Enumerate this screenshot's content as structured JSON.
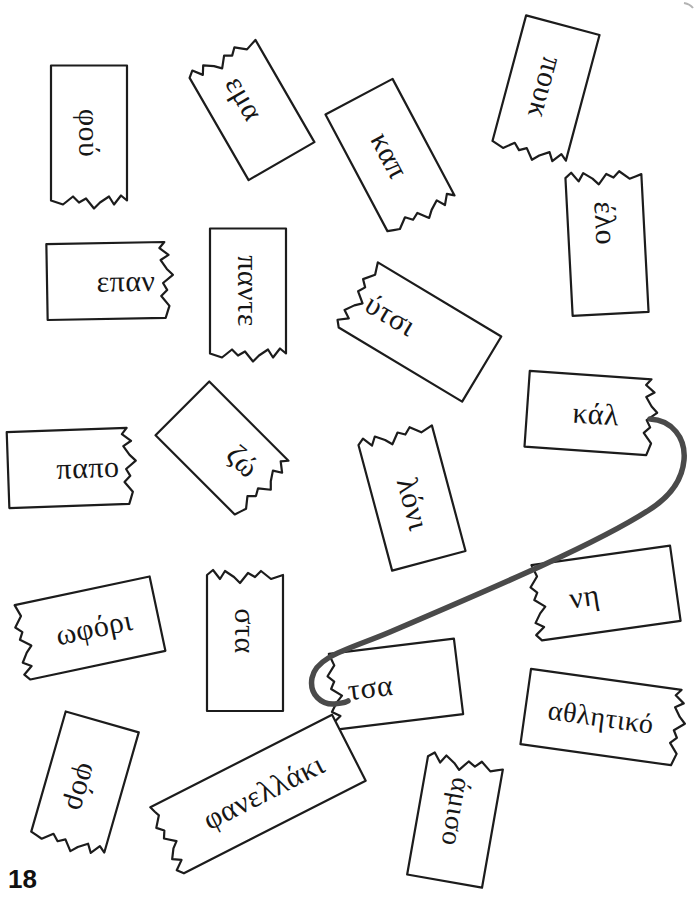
{
  "page": {
    "number": "18"
  },
  "exercise": {
    "kind": "match-torn-word-halves",
    "connection": {
      "from": "κάλ",
      "to": "τσα"
    }
  },
  "pieces": [
    {
      "id": "fou",
      "label": "φού"
    },
    {
      "id": "ema",
      "label": "εμα"
    },
    {
      "id": "kap",
      "label": "καπ"
    },
    {
      "id": "pouk",
      "label": "πουκ"
    },
    {
      "id": "elo",
      "label": "έλο"
    },
    {
      "id": "epan",
      "label": "επαν"
    },
    {
      "id": "pante",
      "label": "παντε"
    },
    {
      "id": "ytsi",
      "label": "ύτσι"
    },
    {
      "id": "papo",
      "label": "παπο"
    },
    {
      "id": "zo",
      "label": "ζώ"
    },
    {
      "id": "loni",
      "label": "λόνι"
    },
    {
      "id": "kal",
      "label": "κάλ"
    },
    {
      "id": "ofori",
      "label": "ωφόρι"
    },
    {
      "id": "sta",
      "label": "στα"
    },
    {
      "id": "ni",
      "label": "νη"
    },
    {
      "id": "tsa",
      "label": "τσα"
    },
    {
      "id": "athlitiko",
      "label": "αθλητικό"
    },
    {
      "id": "for",
      "label": "φόρ"
    },
    {
      "id": "fanellaki",
      "label": "φανελλάκι"
    },
    {
      "id": "amiso",
      "label": "άμισο"
    }
  ],
  "colors": {
    "outline": "#1c1c1c",
    "text": "#161616",
    "connector": "#4a4a4a",
    "artifact": "#b3b3b3"
  }
}
